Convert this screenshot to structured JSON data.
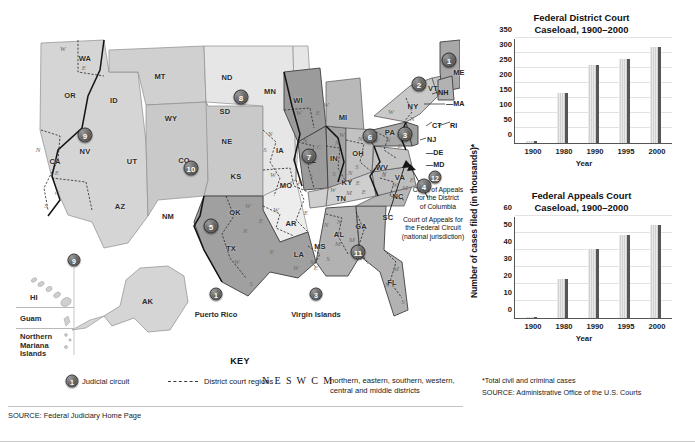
{
  "map": {
    "title_key": "KEY",
    "key": {
      "judicial_circuit_label": "Judicial circuit",
      "district_court_regions_label": "District court regions",
      "neswcm": "N E S W C M",
      "neswcm_description": "northern, eastern, southern, western,\ncentral and middle districts"
    },
    "source": "SOURCE: Federal Judiciary Home Page",
    "callouts": [
      {
        "id": "dc-circuit",
        "text": "Court of Appeals\nfor the District\nof Columbia"
      },
      {
        "id": "federal-circuit",
        "text": "Court of Appeals for\nthe Federal Circuit\n(national jurisdiction)"
      }
    ],
    "abbr_ticks": [
      "DE",
      "MD",
      "MA",
      "RI",
      "CT",
      "NJ",
      "NH"
    ],
    "insets": [
      {
        "label": "HI"
      },
      {
        "label": "Guam"
      },
      {
        "label": "Northern\nMariana\nIslands"
      },
      {
        "label": "AK"
      }
    ],
    "territories": [
      {
        "circuit": "1",
        "name": "Puerto Rico"
      },
      {
        "circuit": "3",
        "name": "Virgin Islands"
      }
    ],
    "circuit_badges": [
      {
        "n": "9",
        "x": 77,
        "y": 125
      },
      {
        "n": "10",
        "x": 183,
        "y": 158
      },
      {
        "n": "8",
        "x": 233,
        "y": 87
      },
      {
        "n": "5",
        "x": 203,
        "y": 216
      },
      {
        "n": "7",
        "x": 301,
        "y": 146
      },
      {
        "n": "6",
        "x": 362,
        "y": 126
      },
      {
        "n": "3",
        "x": 397,
        "y": 124
      },
      {
        "n": "2",
        "x": 411,
        "y": 74
      },
      {
        "n": "1",
        "x": 441,
        "y": 50
      },
      {
        "n": "4",
        "x": 416,
        "y": 176
      },
      {
        "n": "11",
        "x": 350,
        "y": 242
      },
      {
        "n": "12",
        "x": 427,
        "y": 167
      },
      {
        "n": "9",
        "x": 93,
        "y": 259
      }
    ],
    "states": [
      {
        "ab": "WA",
        "x": 77,
        "y": 48
      },
      {
        "ab": "OR",
        "x": 62,
        "y": 85
      },
      {
        "ab": "ID",
        "x": 106,
        "y": 90
      },
      {
        "ab": "MT",
        "x": 152,
        "y": 66
      },
      {
        "ab": "WY",
        "x": 163,
        "y": 108
      },
      {
        "ab": "NV",
        "x": 77,
        "y": 141
      },
      {
        "ab": "CA",
        "x": 47,
        "y": 151
      },
      {
        "ab": "UT",
        "x": 124,
        "y": 151
      },
      {
        "ab": "CO",
        "x": 176,
        "y": 150
      },
      {
        "ab": "AZ",
        "x": 112,
        "y": 196
      },
      {
        "ab": "NM",
        "x": 160,
        "y": 206
      },
      {
        "ab": "ND",
        "x": 219,
        "y": 67
      },
      {
        "ab": "SD",
        "x": 217,
        "y": 101
      },
      {
        "ab": "NE",
        "x": 219,
        "y": 131
      },
      {
        "ab": "KS",
        "x": 228,
        "y": 166
      },
      {
        "ab": "OK",
        "x": 227,
        "y": 202
      },
      {
        "ab": "TX",
        "x": 223,
        "y": 238
      },
      {
        "ab": "MN",
        "x": 262,
        "y": 81
      },
      {
        "ab": "IA",
        "x": 272,
        "y": 140
      },
      {
        "ab": "MO",
        "x": 278,
        "y": 175
      },
      {
        "ab": "AR",
        "x": 283,
        "y": 213
      },
      {
        "ab": "LA",
        "x": 291,
        "y": 244
      },
      {
        "ab": "WI",
        "x": 290,
        "y": 90
      },
      {
        "ab": "IL",
        "x": 305,
        "y": 150
      },
      {
        "ab": "MI",
        "x": 335,
        "y": 107
      },
      {
        "ab": "IN",
        "x": 326,
        "y": 148
      },
      {
        "ab": "OH",
        "x": 350,
        "y": 143
      },
      {
        "ab": "KY",
        "x": 339,
        "y": 172
      },
      {
        "ab": "TN",
        "x": 333,
        "y": 188
      },
      {
        "ab": "MS",
        "x": 312,
        "y": 236
      },
      {
        "ab": "AL",
        "x": 331,
        "y": 224
      },
      {
        "ab": "GA",
        "x": 353,
        "y": 216
      },
      {
        "ab": "FL",
        "x": 384,
        "y": 272
      },
      {
        "ab": "SC",
        "x": 380,
        "y": 207
      },
      {
        "ab": "NC",
        "x": 390,
        "y": 186
      },
      {
        "ab": "VA",
        "x": 392,
        "y": 167
      },
      {
        "ab": "WV",
        "x": 374,
        "y": 157
      },
      {
        "ab": "PA",
        "x": 382,
        "y": 122
      },
      {
        "ab": "NY",
        "x": 405,
        "y": 96
      },
      {
        "ab": "VT",
        "x": 425,
        "y": 78
      },
      {
        "ab": "ME",
        "x": 451,
        "y": 62
      }
    ],
    "district_letters": [
      {
        "t": "E",
        "x": 76,
        "y": 58
      },
      {
        "t": "W",
        "x": 55,
        "y": 39
      },
      {
        "t": "E",
        "x": 49,
        "y": 163
      },
      {
        "t": "N",
        "x": 30,
        "y": 140
      },
      {
        "t": "C",
        "x": 49,
        "y": 183
      },
      {
        "t": "S",
        "x": 38,
        "y": 196
      },
      {
        "t": "N",
        "x": 262,
        "y": 124
      },
      {
        "t": "S",
        "x": 257,
        "y": 140
      },
      {
        "t": "W",
        "x": 265,
        "y": 165
      },
      {
        "t": "E",
        "x": 292,
        "y": 172
      },
      {
        "t": "W",
        "x": 268,
        "y": 200
      },
      {
        "t": "E",
        "x": 298,
        "y": 203
      },
      {
        "t": "W",
        "x": 240,
        "y": 196
      },
      {
        "t": "E",
        "x": 253,
        "y": 211
      },
      {
        "t": "N",
        "x": 237,
        "y": 221
      },
      {
        "t": "W",
        "x": 229,
        "y": 252
      },
      {
        "t": "S",
        "x": 243,
        "y": 274
      },
      {
        "t": "W",
        "x": 288,
        "y": 258
      },
      {
        "t": "E",
        "x": 264,
        "y": 242
      },
      {
        "t": "M",
        "x": 305,
        "y": 252
      },
      {
        "t": "E",
        "x": 308,
        "y": 258
      },
      {
        "t": "W",
        "x": 291,
        "y": 103
      },
      {
        "t": "E",
        "x": 310,
        "y": 103
      },
      {
        "t": "W",
        "x": 318,
        "y": 95
      },
      {
        "t": "N",
        "x": 297,
        "y": 131
      },
      {
        "t": "C",
        "x": 311,
        "y": 137
      },
      {
        "t": "S",
        "x": 303,
        "y": 166
      },
      {
        "t": "N",
        "x": 329,
        "y": 133
      },
      {
        "t": "S",
        "x": 326,
        "y": 164
      },
      {
        "t": "W",
        "x": 325,
        "y": 180
      },
      {
        "t": "M",
        "x": 341,
        "y": 183
      },
      {
        "t": "E",
        "x": 356,
        "y": 182
      },
      {
        "t": "N",
        "x": 342,
        "y": 163
      },
      {
        "t": "E",
        "x": 350,
        "y": 173
      },
      {
        "t": "W",
        "x": 334,
        "y": 125
      },
      {
        "t": "N",
        "x": 352,
        "y": 129
      },
      {
        "t": "S",
        "x": 349,
        "y": 157
      },
      {
        "t": "N",
        "x": 318,
        "y": 215
      },
      {
        "t": "M",
        "x": 330,
        "y": 234
      },
      {
        "t": "S",
        "x": 320,
        "y": 249
      },
      {
        "t": "N",
        "x": 331,
        "y": 212
      },
      {
        "t": "M",
        "x": 344,
        "y": 230
      },
      {
        "t": "S",
        "x": 352,
        "y": 248
      },
      {
        "t": "N",
        "x": 379,
        "y": 275
      },
      {
        "t": "M",
        "x": 388,
        "y": 259
      },
      {
        "t": "S",
        "x": 395,
        "y": 292
      },
      {
        "t": "N",
        "x": 380,
        "y": 130
      },
      {
        "t": "W",
        "x": 368,
        "y": 131
      },
      {
        "t": "M",
        "x": 392,
        "y": 125
      },
      {
        "t": "E",
        "x": 392,
        "y": 136
      },
      {
        "t": "N",
        "x": 404,
        "y": 109
      },
      {
        "t": "S",
        "x": 399,
        "y": 119
      },
      {
        "t": "W",
        "x": 383,
        "y": 102
      },
      {
        "t": "N",
        "x": 376,
        "y": 164
      },
      {
        "t": "S",
        "x": 376,
        "y": 165
      },
      {
        "t": "W",
        "x": 387,
        "y": 175
      },
      {
        "t": "M",
        "x": 397,
        "y": 178
      },
      {
        "t": "E",
        "x": 404,
        "y": 170
      }
    ]
  },
  "charts": {
    "ylabel": "Number of cases filed (in thousands)*",
    "footnote": "*Total civil and criminal cases",
    "source": "SOURCE: Administrative Office of the U.S. Courts"
  },
  "chart_data": [
    {
      "type": "bar",
      "id": "district-court-caseload",
      "title": "Federal District Court\nCaseload, 1900–2000",
      "title_line1": "Federal District Court",
      "title_line2": "Caseload, 1900–2000",
      "categories": [
        "1900",
        "1980",
        "1990",
        "1995",
        "2000"
      ],
      "values": [
        8,
        168,
        260,
        280,
        320
      ],
      "xlabel": "Year",
      "ylabel": "Number of cases filed (in thousands)*",
      "ylim": [
        0,
        350
      ],
      "yticks": [
        0,
        50,
        100,
        150,
        200,
        250,
        300,
        350
      ],
      "grid": true,
      "legend": "none"
    },
    {
      "type": "bar",
      "id": "appeals-court-caseload",
      "title": "Federal Appeals Court\nCaseload, 1900–2000",
      "title_line1": "Federal Appeals Court",
      "title_line2": "Caseload, 1900–2000",
      "categories": [
        "1900",
        "1980",
        "1990",
        "1995",
        "2000"
      ],
      "values": [
        0.6,
        23,
        40.5,
        49,
        55
      ],
      "xlabel": "Year",
      "ylabel": "Number of cases filed (in thousands)*",
      "ylim": [
        0,
        60
      ],
      "yticks": [
        0,
        10,
        20,
        30,
        40,
        50,
        60
      ],
      "grid": true,
      "legend": "none"
    }
  ]
}
